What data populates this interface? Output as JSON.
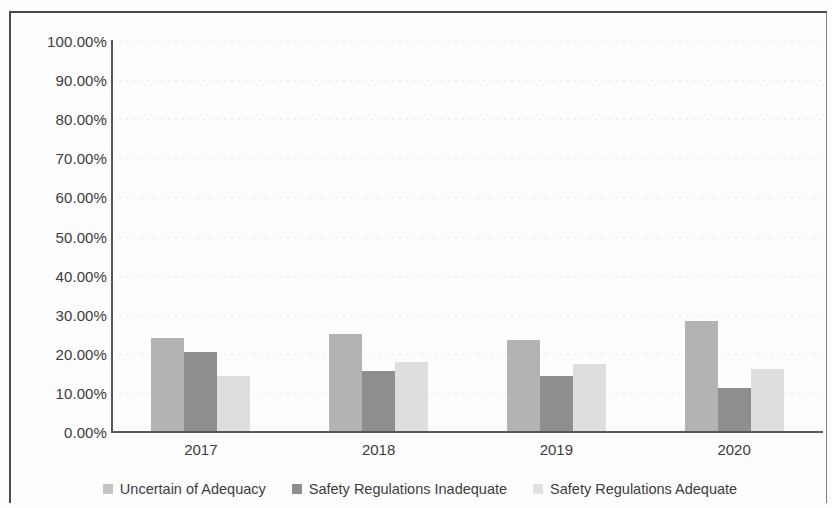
{
  "chart_data": {
    "type": "bar",
    "title": "",
    "subtitle": "",
    "xlabel": "",
    "ylabel": "",
    "categories": [
      "2017",
      "2018",
      "2019",
      "2020"
    ],
    "series": [
      {
        "name": "Uncertain of Adequacy",
        "color": "#b3b3b3",
        "values": [
          24.0,
          25.0,
          23.5,
          28.5
        ]
      },
      {
        "name": "Safety Regulations Inadequate",
        "color": "#8e8e8e",
        "values": [
          20.5,
          15.6,
          14.3,
          11.3
        ]
      },
      {
        "name": "Safety Regulations Adequate",
        "color": "#dedede",
        "values": [
          14.2,
          18.0,
          17.3,
          16.0
        ]
      }
    ],
    "ylim": [
      0,
      100
    ],
    "y_tick_values": [
      100,
      90,
      80,
      70,
      60,
      50,
      40,
      30,
      20,
      10,
      0
    ],
    "y_tick_labels": [
      "100.00%",
      "90.00%",
      "80.00%",
      "70.00%",
      "60.00%",
      "50.00%",
      "40.00%",
      "30.00%",
      "20.00%",
      "10.00%",
      "0.00%"
    ],
    "grid": true,
    "grid_axis": "y",
    "legend_position": "bottom",
    "value_unit": "percent"
  }
}
